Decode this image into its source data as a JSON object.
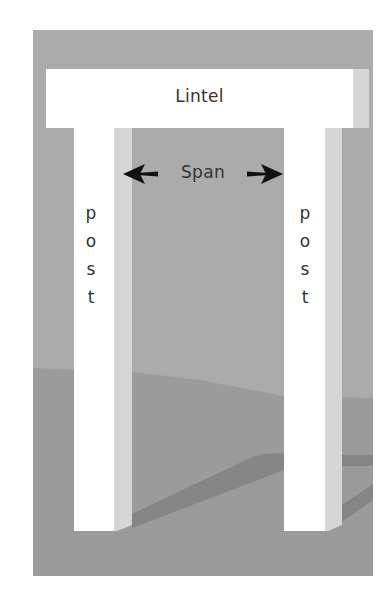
{
  "diagram": {
    "lintel": {
      "label": "Lintel"
    },
    "span": {
      "label": "Span",
      "arrow_left": "arrow-left-icon",
      "arrow_right": "arrow-right-icon"
    },
    "posts": [
      {
        "side": "left",
        "letters": [
          "p",
          "o",
          "s",
          "t"
        ]
      },
      {
        "side": "right",
        "letters": [
          "p",
          "o",
          "s",
          "t"
        ]
      }
    ],
    "colors": {
      "background": "#ffffff",
      "sky": "#ababab",
      "ground": "#9b9b9b",
      "shadow": "#858585",
      "block_front": "#ffffff",
      "block_side": "#d6d6d6",
      "text": "#333333",
      "arrow": "#111111"
    }
  }
}
